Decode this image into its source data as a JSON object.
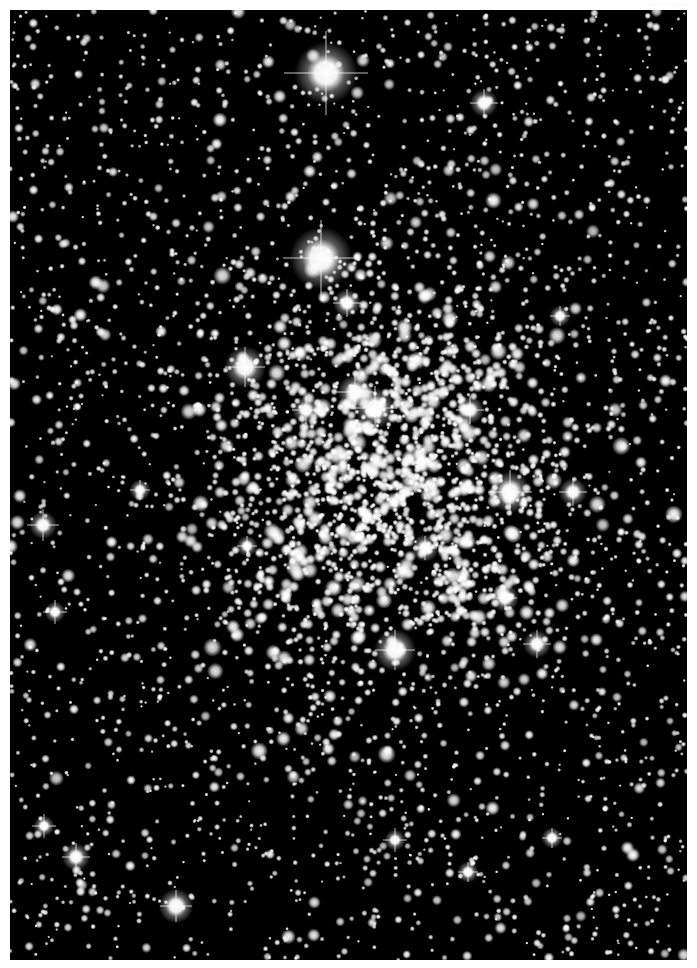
{
  "image": {
    "subject": "open star cluster field",
    "caption": "··· ···· ·······",
    "frame": {
      "x": 10,
      "y": 10,
      "width": 677,
      "height": 950
    },
    "colors": {
      "background": "#000000",
      "margin": "#ffffff",
      "star": "#ffffff"
    },
    "bright_stars": [
      {
        "x": 326,
        "y": 73,
        "r": 9,
        "spike": 42
      },
      {
        "x": 321,
        "y": 258,
        "r": 9,
        "spike": 38
      },
      {
        "x": 375,
        "y": 408,
        "r": 6,
        "spike": 22
      },
      {
        "x": 355,
        "y": 392,
        "r": 5,
        "spike": 18
      },
      {
        "x": 245,
        "y": 367,
        "r": 6,
        "spike": 20
      },
      {
        "x": 510,
        "y": 492,
        "r": 6,
        "spike": 22
      },
      {
        "x": 395,
        "y": 650,
        "r": 6,
        "spike": 20
      },
      {
        "x": 43,
        "y": 525,
        "r": 4,
        "spike": 16
      },
      {
        "x": 484,
        "y": 103,
        "r": 4,
        "spike": 14
      },
      {
        "x": 176,
        "y": 906,
        "r": 5,
        "spike": 16
      },
      {
        "x": 76,
        "y": 857,
        "r": 4,
        "spike": 14
      },
      {
        "x": 573,
        "y": 492,
        "r": 4,
        "spike": 14
      },
      {
        "x": 537,
        "y": 644,
        "r": 4,
        "spike": 14
      },
      {
        "x": 55,
        "y": 612,
        "r": 3,
        "spike": 12
      },
      {
        "x": 347,
        "y": 303,
        "r": 4,
        "spike": 14
      },
      {
        "x": 470,
        "y": 410,
        "r": 4,
        "spike": 14
      },
      {
        "x": 505,
        "y": 598,
        "r": 4,
        "spike": 12
      },
      {
        "x": 560,
        "y": 316,
        "r": 3,
        "spike": 10
      },
      {
        "x": 306,
        "y": 410,
        "r": 4,
        "spike": 14
      },
      {
        "x": 140,
        "y": 490,
        "r": 3,
        "spike": 10
      },
      {
        "x": 44,
        "y": 826,
        "r": 3,
        "spike": 12
      },
      {
        "x": 395,
        "y": 840,
        "r": 3,
        "spike": 12
      },
      {
        "x": 552,
        "y": 838,
        "r": 3,
        "spike": 10
      },
      {
        "x": 468,
        "y": 872,
        "r": 3,
        "spike": 10
      },
      {
        "x": 425,
        "y": 548,
        "r": 4,
        "spike": 12
      },
      {
        "x": 247,
        "y": 546,
        "r": 3,
        "spike": 10
      }
    ],
    "field": {
      "seed": 1337,
      "count": 2600,
      "cluster_count": 1500,
      "cluster_center": {
        "x": 385,
        "y": 480
      },
      "cluster_radius": {
        "x": 170,
        "y": 200
      }
    }
  }
}
